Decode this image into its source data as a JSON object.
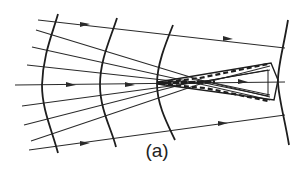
{
  "figure": {
    "caption": "(a)",
    "colors": {
      "stroke": "#2a2a2a",
      "background": "#ffffff"
    },
    "wavefronts_count": 4,
    "rays_count": 8,
    "elements": [
      "converging-rays",
      "curved-wavefronts",
      "direction-arrows",
      "focal-caustic-region",
      "dashed-focus-cone"
    ]
  }
}
